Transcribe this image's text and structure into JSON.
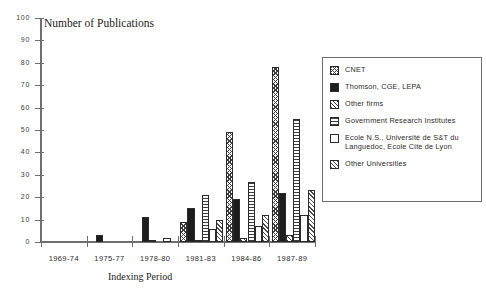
{
  "chart_data": {
    "type": "bar",
    "title": "Number of Publications",
    "xlabel": "Indexing Period",
    "ylabel": "",
    "ylim": [
      0,
      100
    ],
    "yticks": [
      0,
      10,
      20,
      30,
      40,
      50,
      60,
      70,
      80,
      90,
      100
    ],
    "grid": false,
    "legend_position": "right",
    "categories": [
      "1969-74",
      "1975-77",
      "1978-80",
      "1981-83",
      "1984-86",
      "1987-89"
    ],
    "series": [
      {
        "name": "CNET",
        "pattern": "crosshatch",
        "values": [
          0,
          0,
          0,
          9,
          49,
          78
        ]
      },
      {
        "name": "Thomson, CGE, LEPA",
        "pattern": "solid-black",
        "values": [
          0,
          3,
          11,
          15,
          19,
          22
        ]
      },
      {
        "name": "Other firms",
        "pattern": "diagonal",
        "values": [
          0,
          0,
          1,
          1,
          2,
          3
        ]
      },
      {
        "name": "Government Research Institutes",
        "pattern": "horizontal",
        "values": [
          0,
          0,
          0,
          21,
          27,
          55
        ]
      },
      {
        "name": "Ecole N.S., Université de S&T du Languedoc, Ecole Cite de Lyon",
        "pattern": "white",
        "values": [
          0,
          0,
          2,
          6,
          7,
          12
        ]
      },
      {
        "name": "Other Universities",
        "pattern": "diagonal2",
        "values": [
          0,
          0,
          0,
          10,
          12,
          23
        ]
      }
    ]
  },
  "axis": {
    "y_tick_labels": [
      "0",
      "10",
      "20",
      "30",
      "40",
      "50",
      "60",
      "70",
      "80",
      "90",
      "100"
    ],
    "x_tick_labels": [
      "1969-74",
      "1975-77",
      "1978-80",
      "1981-83",
      "1984-86",
      "1987-89"
    ]
  },
  "legend": {
    "entries": [
      {
        "label": "CNET"
      },
      {
        "label": "Thomson, CGE, LEPA"
      },
      {
        "label": "Other firms"
      },
      {
        "label": "Government Research Institutes"
      },
      {
        "label": "Ecole N.S., Université de S&T du Languedoc, Ecole Cite de Lyon"
      },
      {
        "label": "Other Universities"
      }
    ]
  },
  "colors": {
    "axis": "#6f6f6f",
    "bar_outline": "#2a2a2a",
    "hatch": "#3c3c3c",
    "solid": "#1d1d1d",
    "text": "#2b2b2b",
    "background": "#ffffff"
  }
}
